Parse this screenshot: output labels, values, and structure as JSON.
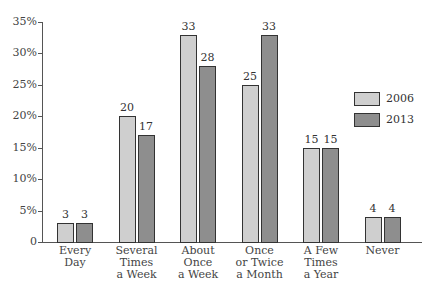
{
  "chart_data": {
    "type": "bar",
    "title": "",
    "xlabel": "",
    "ylabel": "",
    "ylim": [
      0,
      35
    ],
    "yticks": [
      "0",
      "5%",
      "10%",
      "15%",
      "20%",
      "25%",
      "30%",
      "35%"
    ],
    "categories": [
      "Every\nDay",
      "Several\nTimes\na Week",
      "About\nOnce\na Week",
      "Once\nor Twice\na Month",
      "A Few\nTimes\na Year",
      "Never"
    ],
    "series": [
      {
        "name": "2006",
        "color": "#cfcfcf",
        "values": [
          3,
          20,
          33,
          25,
          15,
          4
        ]
      },
      {
        "name": "2013",
        "color": "#8e8e8e",
        "values": [
          3,
          17,
          28,
          33,
          15,
          4
        ]
      }
    ],
    "data_labels": true,
    "grid": false,
    "legend_position": "right"
  }
}
